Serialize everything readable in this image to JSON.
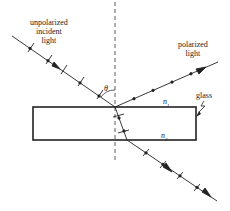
{
  "labels": {
    "incident": [
      "unpolarized",
      "incident",
      "light"
    ],
    "reflected": [
      "polarized",
      "light"
    ],
    "glass": "glass",
    "theta": "θ",
    "n1": "n",
    "n1_sub": "1",
    "n2": "n",
    "n2_sub": "2"
  },
  "colors": {
    "line": "#222222",
    "background": "#ffffff"
  }
}
